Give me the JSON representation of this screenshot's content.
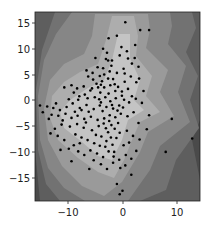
{
  "chart_data": {
    "type": "scatter",
    "title": "",
    "xlabel": "",
    "ylabel": "",
    "xlim": [
      -15.8,
      14.0
    ],
    "ylim": [
      -19.5,
      17.1
    ],
    "grid": false,
    "legend": null,
    "background": "filled contour (grayscale density bands, light center to dark edges)",
    "x_ticks": [
      -10,
      0,
      10
    ],
    "x_tick_labels": [
      "−10",
      "0",
      "10"
    ],
    "y_ticks": [
      15,
      10,
      5,
      0,
      -5,
      -10,
      -15
    ],
    "y_tick_labels": [
      "15",
      "10",
      "5",
      "0",
      "−5",
      "−10",
      "−15"
    ],
    "contour_colors": [
      "#4a4a4a",
      "#5e5e5e",
      "#727272",
      "#868686",
      "#9a9a9a",
      "#adadad",
      "#c4c4c4"
    ],
    "point_color": "#000000",
    "series": [
      {
        "name": "points",
        "points": [
          [
            0.5,
            15.1
          ],
          [
            3.2,
            13.6
          ],
          [
            4.8,
            13.6
          ],
          [
            -1.0,
            12.5
          ],
          [
            2.3,
            10.7
          ],
          [
            0.8,
            9.5
          ],
          [
            -0.5,
            8.7
          ],
          [
            1.0,
            8.1
          ],
          [
            2.2,
            8.2
          ],
          [
            -3.5,
            10.0
          ],
          [
            -2.8,
            9.2
          ],
          [
            -3.0,
            8.0
          ],
          [
            -1.9,
            7.7
          ],
          [
            -2.0,
            6.7
          ],
          [
            -3.5,
            6.2
          ],
          [
            -4.5,
            6.4
          ],
          [
            0.2,
            6.1
          ],
          [
            -1.0,
            5.3
          ],
          [
            -2.3,
            5.6
          ],
          [
            -3.3,
            5.0
          ],
          [
            -4.1,
            4.7
          ],
          [
            -2.6,
            4.2
          ],
          [
            -3.7,
            3.7
          ],
          [
            -1.4,
            3.1
          ],
          [
            -2.2,
            2.9
          ],
          [
            -4.7,
            3.2
          ],
          [
            -5.3,
            4.0
          ],
          [
            -3.3,
            2.5
          ],
          [
            0.4,
            5.2
          ],
          [
            1.5,
            4.6
          ],
          [
            2.5,
            3.5
          ],
          [
            1.0,
            2.2
          ],
          [
            -0.1,
            1.7
          ],
          [
            -1.3,
            1.8
          ],
          [
            -2.5,
            1.3
          ],
          [
            -4.0,
            1.5
          ],
          [
            -5.8,
            1.9
          ],
          [
            -7.0,
            2.7
          ],
          [
            -8.2,
            2.3
          ],
          [
            -9.2,
            2.9
          ],
          [
            -10.5,
            2.5
          ],
          [
            -8.8,
            1.5
          ],
          [
            -7.8,
            0.8
          ],
          [
            -6.3,
            0.4
          ],
          [
            -5.0,
            0.6
          ],
          [
            -4.2,
            0.2
          ],
          [
            -3.1,
            0.6
          ],
          [
            -2.2,
            -0.2
          ],
          [
            -1.2,
            0.4
          ],
          [
            0.3,
            0.1
          ],
          [
            1.2,
            -0.4
          ],
          [
            2.4,
            0.3
          ],
          [
            3.5,
            -0.5
          ],
          [
            -0.6,
            -1.0
          ],
          [
            -1.7,
            -1.6
          ],
          [
            -2.9,
            -1.3
          ],
          [
            -4.1,
            -1.0
          ],
          [
            -5.2,
            -1.7
          ],
          [
            -6.5,
            -0.9
          ],
          [
            -7.7,
            -1.5
          ],
          [
            -9.0,
            -0.6
          ],
          [
            -10.1,
            -1.3
          ],
          [
            -11.3,
            -1.9
          ],
          [
            -12.5,
            -1.5
          ],
          [
            -13.6,
            -1.2
          ],
          [
            -14.4,
            -2.3
          ],
          [
            -12.8,
            -2.8
          ],
          [
            -11.6,
            -3.0
          ],
          [
            -10.3,
            -2.6
          ],
          [
            -9.2,
            -3.4
          ],
          [
            -8.1,
            -3.0
          ],
          [
            -6.9,
            -3.6
          ],
          [
            -5.7,
            -3.2
          ],
          [
            -4.5,
            -3.8
          ],
          [
            -3.3,
            -3.5
          ],
          [
            -2.3,
            -2.9
          ],
          [
            -1.3,
            -3.3
          ],
          [
            -0.3,
            -2.6
          ],
          [
            0.9,
            -3.1
          ],
          [
            2.0,
            -2.3
          ],
          [
            -0.8,
            -4.4
          ],
          [
            -2.0,
            -4.8
          ],
          [
            -3.0,
            -5.4
          ],
          [
            -4.3,
            -5.0
          ],
          [
            -5.5,
            -5.8
          ],
          [
            -7.0,
            -5.3
          ],
          [
            -8.2,
            -4.6
          ],
          [
            -9.5,
            -5.1
          ],
          [
            -11.0,
            -4.7
          ],
          [
            -12.2,
            -5.5
          ],
          [
            -13.0,
            -6.4
          ],
          [
            -8.5,
            -6.6
          ],
          [
            -7.4,
            -7.2
          ],
          [
            -6.3,
            -7.7
          ],
          [
            -5.1,
            -8.3
          ],
          [
            -3.8,
            -7.0
          ],
          [
            -2.9,
            -7.9
          ],
          [
            -1.8,
            -8.6
          ],
          [
            -0.5,
            -6.3
          ],
          [
            0.8,
            -5.9
          ],
          [
            1.9,
            -6.9
          ],
          [
            3.1,
            -7.6
          ],
          [
            4.4,
            -5.6
          ],
          [
            -8.8,
            -8.7
          ],
          [
            -9.7,
            -9.4
          ],
          [
            -8.0,
            -9.9
          ],
          [
            -6.9,
            -10.6
          ],
          [
            -5.8,
            -9.7
          ],
          [
            -4.6,
            -10.3
          ],
          [
            -3.5,
            -11.0
          ],
          [
            -2.5,
            -9.9
          ],
          [
            -1.6,
            -10.9
          ],
          [
            -0.6,
            -11.5
          ],
          [
            0.6,
            -10.6
          ],
          [
            1.6,
            -11.3
          ],
          [
            2.5,
            -9.8
          ],
          [
            -3.9,
            -12.4
          ],
          [
            -2.8,
            -13.3
          ],
          [
            -1.7,
            -12.1
          ],
          [
            -0.4,
            -13.1
          ],
          [
            0.5,
            -12.6
          ],
          [
            1.6,
            -14.4
          ],
          [
            -1.0,
            -16.2
          ],
          [
            0.0,
            -17.5
          ],
          [
            -0.5,
            -18.2
          ],
          [
            7.8,
            -10.0
          ],
          [
            12.6,
            -7.4
          ],
          [
            8.9,
            -3.6
          ],
          [
            -6.0,
            -13.3
          ],
          [
            -6.5,
            5.8
          ],
          [
            -6.2,
            4.6
          ],
          [
            -4.9,
            8.2
          ],
          [
            -2.5,
            12.0
          ],
          [
            -7.4,
            -1.9
          ],
          [
            -6.1,
            -2.2
          ],
          [
            -3.6,
            -2.1
          ],
          [
            -2.6,
            -6.2
          ],
          [
            -1.1,
            -7.3
          ],
          [
            -4.8,
            -6.7
          ],
          [
            -6.6,
            -4.3
          ],
          [
            -10.8,
            -3.9
          ],
          [
            -12.0,
            -0.6
          ],
          [
            -9.7,
            0.2
          ],
          [
            -8.6,
            -2.2
          ],
          [
            -5.5,
            2.3
          ],
          [
            -4.4,
            2.5
          ],
          [
            -3.9,
            -0.4
          ],
          [
            -1.9,
            -0.9
          ],
          [
            -0.9,
            -2.0
          ],
          [
            0.1,
            -1.4
          ],
          [
            -2.4,
            -4.0
          ],
          [
            -3.4,
            -4.5
          ],
          [
            -1.4,
            -5.5
          ],
          [
            -2.1,
            -7.2
          ],
          [
            -3.1,
            -9.0
          ],
          [
            -4.1,
            -8.8
          ],
          [
            -5.2,
            -11.6
          ],
          [
            -7.7,
            -8.3
          ],
          [
            -10.5,
            -7.7
          ],
          [
            -11.7,
            -6.9
          ],
          [
            0.2,
            -8.7
          ],
          [
            1.2,
            -8.2
          ],
          [
            2.9,
            -4.4
          ],
          [
            4.8,
            -2.9
          ],
          [
            3.8,
            1.8
          ],
          [
            3.0,
            4.2
          ],
          [
            1.7,
            7.1
          ],
          [
            2.9,
            6.5
          ],
          [
            -0.2,
            10.3
          ],
          [
            0.4,
            3.6
          ],
          [
            -0.8,
            2.6
          ],
          [
            -1.7,
            4.1
          ],
          [
            -5.4,
            5.3
          ],
          [
            -2.6,
            7.7
          ],
          [
            -3.9,
            3.0
          ],
          [
            -6.8,
            1.1
          ],
          [
            -8.0,
            0.1
          ],
          [
            -13.3,
            -3.6
          ],
          [
            -14.9,
            -1.0
          ],
          [
            -11.2,
            -9.6
          ],
          [
            -9.2,
            -11.8
          ],
          [
            -0.1,
            0.9
          ],
          [
            1.7,
            0.8
          ],
          [
            -1.5,
            -10.0
          ]
        ]
      }
    ]
  }
}
